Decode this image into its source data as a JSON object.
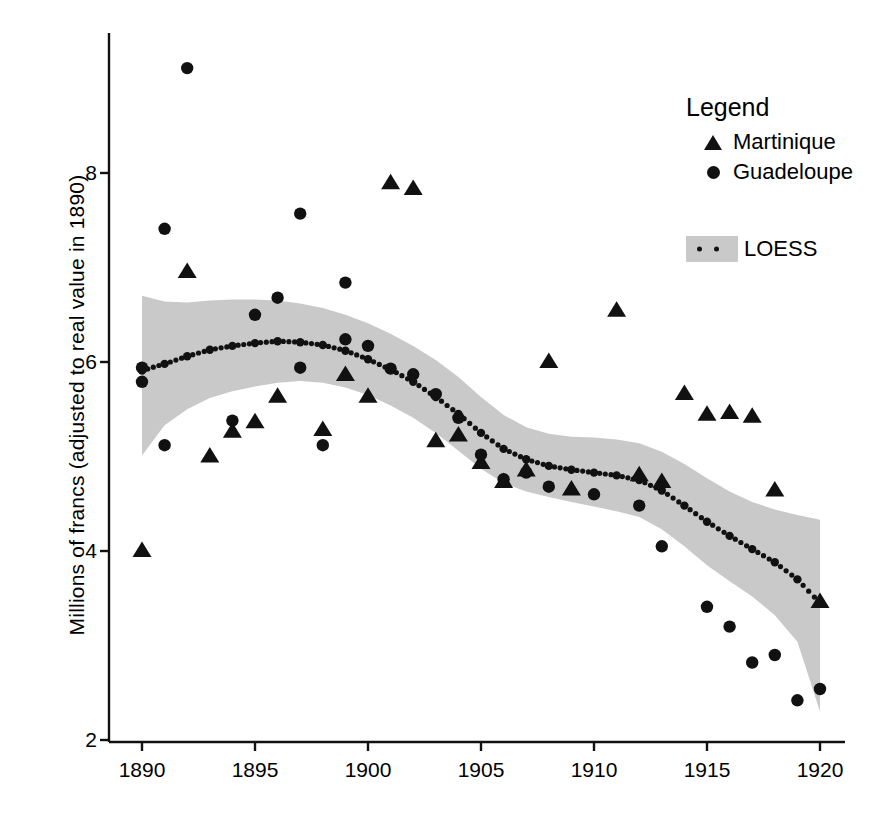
{
  "chart_data": {
    "type": "scatter",
    "title": "",
    "xlabel": "",
    "ylabel": "Millions of francs (adjusted to real value in 1890)",
    "xlim": [
      1889.0,
      1921.0
    ],
    "ylim": [
      2.0,
      9.4
    ],
    "xticks": [
      1890,
      1895,
      1900,
      1905,
      1910,
      1915,
      1920
    ],
    "yticks": [
      2,
      4,
      6,
      8
    ],
    "xtick_labels": [
      "1890",
      "1895",
      "1900",
      "1905",
      "1910",
      "1915",
      "1920"
    ],
    "ytick_labels": [
      "2",
      "4",
      "6",
      "8"
    ],
    "grid": false,
    "legend_position": "top-right",
    "series": [
      {
        "name": "Martinique",
        "marker": "triangle",
        "color": "#111111",
        "points": [
          [
            1890,
            4.0
          ],
          [
            1892,
            6.95
          ],
          [
            1893,
            5.0
          ],
          [
            1894,
            5.26
          ],
          [
            1895,
            5.36
          ],
          [
            1896,
            5.63
          ],
          [
            1898,
            5.28
          ],
          [
            1899,
            5.86
          ],
          [
            1900,
            5.63
          ],
          [
            1901,
            7.89
          ],
          [
            1902,
            7.83
          ],
          [
            1903,
            5.16
          ],
          [
            1904,
            5.22
          ],
          [
            1905,
            4.93
          ],
          [
            1906,
            4.73
          ],
          [
            1907,
            4.85
          ],
          [
            1908,
            6.0
          ],
          [
            1909,
            4.65
          ],
          [
            1911,
            6.54
          ],
          [
            1912,
            4.8
          ],
          [
            1913,
            4.73
          ],
          [
            1914,
            5.66
          ],
          [
            1915,
            5.44
          ],
          [
            1916,
            5.46
          ],
          [
            1917,
            5.42
          ],
          [
            1918,
            4.64
          ],
          [
            1920,
            3.46
          ]
        ]
      },
      {
        "name": "Guadeloupe",
        "marker": "circle",
        "color": "#111111",
        "points": [
          [
            1890,
            5.94
          ],
          [
            1890,
            5.79
          ],
          [
            1891,
            7.41
          ],
          [
            1891,
            5.12
          ],
          [
            1892,
            9.11
          ],
          [
            1894,
            5.38
          ],
          [
            1895,
            6.5
          ],
          [
            1896,
            6.68
          ],
          [
            1897,
            7.57
          ],
          [
            1897,
            5.94
          ],
          [
            1898,
            5.12
          ],
          [
            1899,
            6.84
          ],
          [
            1899,
            6.24
          ],
          [
            1900,
            6.17
          ],
          [
            1901,
            5.93
          ],
          [
            1902,
            5.87
          ],
          [
            1903,
            5.66
          ],
          [
            1904,
            5.41
          ],
          [
            1905,
            5.02
          ],
          [
            1906,
            4.76
          ],
          [
            1907,
            4.83
          ],
          [
            1908,
            4.68
          ],
          [
            1910,
            4.6
          ],
          [
            1912,
            4.48
          ],
          [
            1913,
            4.05
          ],
          [
            1915,
            3.41
          ],
          [
            1916,
            3.2
          ],
          [
            1917,
            2.82
          ],
          [
            1918,
            2.9
          ],
          [
            1919,
            2.42
          ],
          [
            1920,
            2.54
          ]
        ]
      }
    ],
    "loess": {
      "name": "LOESS",
      "style": "dotted",
      "band_color": "#c9c9c9",
      "line_color": "#111111",
      "fit": [
        [
          1890,
          5.91
        ],
        [
          1891,
          5.98
        ],
        [
          1892,
          6.06
        ],
        [
          1893,
          6.13
        ],
        [
          1894,
          6.17
        ],
        [
          1895,
          6.2
        ],
        [
          1896,
          6.22
        ],
        [
          1897,
          6.21
        ],
        [
          1898,
          6.18
        ],
        [
          1899,
          6.12
        ],
        [
          1900,
          6.03
        ],
        [
          1901,
          5.92
        ],
        [
          1902,
          5.79
        ],
        [
          1903,
          5.63
        ],
        [
          1904,
          5.45
        ],
        [
          1905,
          5.25
        ],
        [
          1906,
          5.08
        ],
        [
          1907,
          4.97
        ],
        [
          1908,
          4.9
        ],
        [
          1909,
          4.86
        ],
        [
          1910,
          4.83
        ],
        [
          1911,
          4.8
        ],
        [
          1912,
          4.75
        ],
        [
          1913,
          4.64
        ],
        [
          1914,
          4.48
        ],
        [
          1915,
          4.31
        ],
        [
          1916,
          4.16
        ],
        [
          1917,
          4.02
        ],
        [
          1918,
          3.88
        ],
        [
          1919,
          3.7
        ],
        [
          1920,
          3.45
        ]
      ],
      "upper": [
        [
          1890,
          6.7
        ],
        [
          1891,
          6.64
        ],
        [
          1892,
          6.63
        ],
        [
          1893,
          6.65
        ],
        [
          1894,
          6.66
        ],
        [
          1895,
          6.66
        ],
        [
          1896,
          6.65
        ],
        [
          1897,
          6.62
        ],
        [
          1898,
          6.57
        ],
        [
          1899,
          6.5
        ],
        [
          1900,
          6.41
        ],
        [
          1901,
          6.3
        ],
        [
          1902,
          6.17
        ],
        [
          1903,
          6.02
        ],
        [
          1904,
          5.84
        ],
        [
          1905,
          5.63
        ],
        [
          1906,
          5.44
        ],
        [
          1907,
          5.31
        ],
        [
          1908,
          5.24
        ],
        [
          1909,
          5.21
        ],
        [
          1910,
          5.2
        ],
        [
          1911,
          5.18
        ],
        [
          1912,
          5.14
        ],
        [
          1913,
          5.05
        ],
        [
          1914,
          4.92
        ],
        [
          1915,
          4.77
        ],
        [
          1916,
          4.63
        ],
        [
          1917,
          4.52
        ],
        [
          1918,
          4.44
        ],
        [
          1919,
          4.38
        ],
        [
          1920,
          4.33
        ]
      ],
      "lower": [
        [
          1890,
          5.01
        ],
        [
          1891,
          5.33
        ],
        [
          1892,
          5.5
        ],
        [
          1893,
          5.62
        ],
        [
          1894,
          5.69
        ],
        [
          1895,
          5.74
        ],
        [
          1896,
          5.78
        ],
        [
          1897,
          5.8
        ],
        [
          1898,
          5.78
        ],
        [
          1899,
          5.73
        ],
        [
          1900,
          5.65
        ],
        [
          1901,
          5.54
        ],
        [
          1902,
          5.41
        ],
        [
          1903,
          5.25
        ],
        [
          1904,
          5.06
        ],
        [
          1905,
          4.87
        ],
        [
          1906,
          4.72
        ],
        [
          1907,
          4.63
        ],
        [
          1908,
          4.57
        ],
        [
          1909,
          4.52
        ],
        [
          1910,
          4.47
        ],
        [
          1911,
          4.42
        ],
        [
          1912,
          4.36
        ],
        [
          1913,
          4.23
        ],
        [
          1914,
          4.05
        ],
        [
          1915,
          3.85
        ],
        [
          1916,
          3.68
        ],
        [
          1917,
          3.52
        ],
        [
          1918,
          3.32
        ],
        [
          1919,
          3.04
        ],
        [
          1920,
          2.3
        ]
      ]
    }
  },
  "axis": {
    "y_title": "Millions of francs (adjusted to real value in 1890)"
  },
  "legend": {
    "title": "Legend",
    "items": [
      {
        "label": "Martinique",
        "marker": "triangle"
      },
      {
        "label": "Guadeloupe",
        "marker": "circle"
      }
    ],
    "loess_label": "LOESS"
  }
}
